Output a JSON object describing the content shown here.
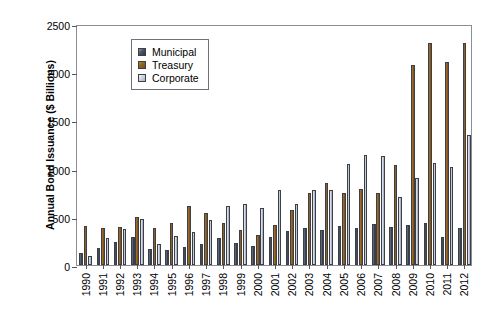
{
  "chart_data": {
    "type": "bar",
    "title": "",
    "xlabel": "",
    "ylabel": "Annual Bond Issuance ($ Billions)",
    "ylim": [
      0,
      2500
    ],
    "yticks": [
      0,
      500,
      1000,
      1500,
      2000,
      2500
    ],
    "grid": false,
    "legend_position": "top-left-inside",
    "categories": [
      "1990",
      "1991",
      "1992",
      "1993",
      "1994",
      "1995",
      "1996",
      "1997",
      "1998",
      "1999",
      "2000",
      "2001",
      "2002",
      "2003",
      "2004",
      "2005",
      "2006",
      "2007",
      "2008",
      "2009",
      "2010",
      "2011",
      "2012"
    ],
    "series": [
      {
        "name": "Municipal",
        "color": "#434b5a",
        "values": [
          128,
          172,
          235,
          292,
          165,
          155,
          185,
          220,
          285,
          228,
          200,
          288,
          358,
          383,
          360,
          408,
          387,
          429,
          390,
          410,
          433,
          295,
          380
        ]
      },
      {
        "name": "Treasury",
        "color": "#8a5b1f",
        "values": [
          400,
          385,
          397,
          500,
          385,
          440,
          612,
          540,
          438,
          365,
          312,
          418,
          572,
          745,
          853,
          746,
          788,
          752,
          1037,
          2075,
          2305,
          2103,
          2305
        ]
      },
      {
        "name": "Corporate",
        "color": "#c2cbd9",
        "values": [
          90,
          280,
          375,
          480,
          220,
          300,
          345,
          465,
          610,
          630,
          588,
          783,
          635,
          777,
          782,
          1050,
          1137,
          1128,
          710,
          900,
          1060,
          1018,
          1350
        ]
      }
    ]
  },
  "legend": {
    "items": [
      {
        "label": "Municipal"
      },
      {
        "label": "Treasury"
      },
      {
        "label": "Corporate"
      }
    ]
  }
}
